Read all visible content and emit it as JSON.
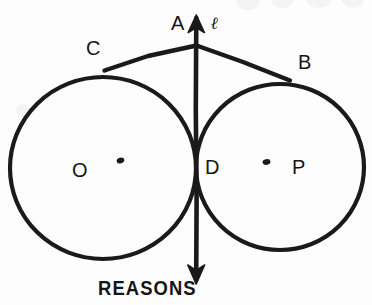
{
  "figure": {
    "type": "geometry-diagram",
    "caption": "REASONS",
    "ink_color": "#1a1a1a",
    "background_color": "#fdfdfd",
    "labels": {
      "apex": "A",
      "line": "ℓ",
      "left_tangency": "C",
      "right_tangency": "B",
      "left_center": "O",
      "right_center": "P",
      "tangent_point": "D"
    },
    "label_positions": {
      "apex": {
        "x": 171,
        "y": 13
      },
      "line": {
        "x": 211,
        "y": 14
      },
      "left_tangency": {
        "x": 86,
        "y": 38
      },
      "right_tangency": {
        "x": 298,
        "y": 52
      },
      "left_center": {
        "x": 72,
        "y": 160
      },
      "right_center": {
        "x": 292,
        "y": 157
      },
      "tangent_point": {
        "x": 205,
        "y": 157
      },
      "caption": {
        "x": 98,
        "y": 280
      }
    },
    "circles": [
      {
        "name": "circle-O",
        "cx": 103,
        "cy": 168,
        "r": 92,
        "center_label": "O",
        "center_dot": {
          "x": 120,
          "y": 160
        }
      },
      {
        "name": "circle-P",
        "cx": 280,
        "cy": 167,
        "r": 83,
        "center_label": "P",
        "center_dot": {
          "x": 266,
          "y": 162
        }
      }
    ],
    "points": {
      "A": {
        "x": 196,
        "y": 45
      },
      "C": {
        "x": 104,
        "y": 71
      },
      "B": {
        "x": 289,
        "y": 80
      },
      "D": {
        "x": 196,
        "y": 166
      }
    },
    "vertical_line": {
      "x": 196,
      "top_y": 16,
      "bottom_y": 284
    },
    "tangent_segments": [
      {
        "name": "segment-AC",
        "from": "A",
        "to": "C"
      },
      {
        "name": "segment-AB",
        "from": "A",
        "to": "B"
      }
    ],
    "arrowheads": [
      "up",
      "down"
    ]
  }
}
